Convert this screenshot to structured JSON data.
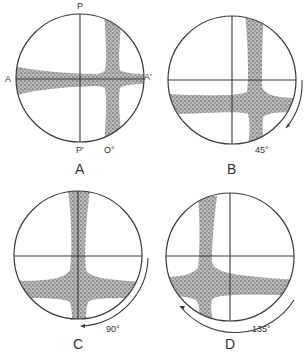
{
  "figure": {
    "panels": [
      {
        "id": "A",
        "caption": "A",
        "rotation_label": "O°",
        "rotation_deg": 0,
        "pole_top": "P",
        "pole_bottom": "P'",
        "axis_left": "A",
        "axis_right": "A'"
      },
      {
        "id": "B",
        "caption": "B",
        "rotation_label": "45°",
        "rotation_deg": 45
      },
      {
        "id": "C",
        "caption": "C",
        "rotation_label": "90°",
        "rotation_deg": 90
      },
      {
        "id": "D",
        "caption": "D",
        "rotation_label": "135°",
        "rotation_deg": 135
      }
    ],
    "colors": {
      "line": "#3a3a3a",
      "stipple": "#8a8a8a",
      "background": "#ffffff"
    }
  }
}
